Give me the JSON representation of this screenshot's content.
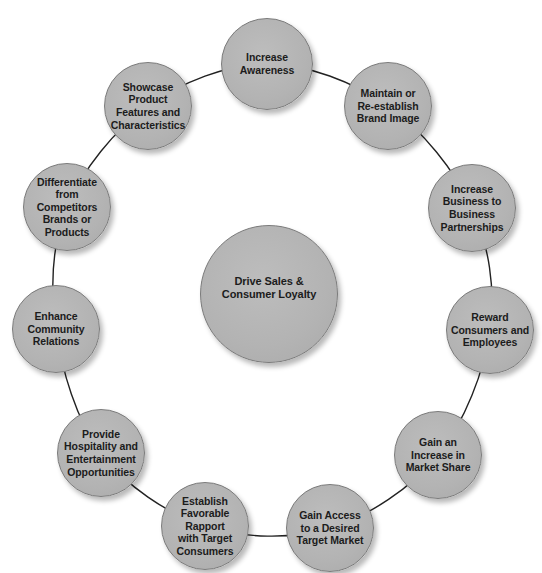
{
  "diagram": {
    "type": "hub-and-ring",
    "colors": {
      "node_fill": "#b5b5b5",
      "node_border": "#7a7a7a",
      "connector": "#222222",
      "text": "#1c1c1c",
      "background": "#ffffff"
    },
    "center": {
      "label": "Drive Sales &\nConsumer Loyalty",
      "x": 269,
      "y": 294,
      "r": 69
    },
    "ring_nodes": [
      {
        "id": "increase-awareness",
        "label": "Increase\nAwareness",
        "x": 267,
        "y": 64,
        "r": 46
      },
      {
        "id": "maintain-brand-image",
        "label": "Maintain or\nRe-establish\nBrand Image",
        "x": 388,
        "y": 106,
        "r": 44
      },
      {
        "id": "increase-b2b",
        "label": "Increase\nBusiness to\nBusiness\nPartnerships",
        "x": 472,
        "y": 208,
        "r": 44
      },
      {
        "id": "reward-consumers",
        "label": "Reward\nConsumers and\nEmployees",
        "x": 490,
        "y": 330,
        "r": 44
      },
      {
        "id": "increase-market-share",
        "label": "Gain an\nIncrease in\nMarket Share",
        "x": 438,
        "y": 455,
        "r": 44
      },
      {
        "id": "gain-access-target-market",
        "label": "Gain Access\nto a Desired\nTarget Market",
        "x": 330,
        "y": 528,
        "r": 44
      },
      {
        "id": "establish-rapport",
        "label": "Establish\nFavorable\nRapport\nwith Target\nConsumers",
        "x": 205,
        "y": 526,
        "r": 44
      },
      {
        "id": "provide-hospitality",
        "label": "Provide\nHospitality and\nEntertainment\nOpportunities",
        "x": 101,
        "y": 453,
        "r": 44
      },
      {
        "id": "enhance-community",
        "label": "Enhance\nCommunity\nRelations",
        "x": 56,
        "y": 329,
        "r": 44
      },
      {
        "id": "differentiate-competitors",
        "label": "Differentiate\nfrom\nCompetitors\nBrands or\nProducts",
        "x": 67,
        "y": 207,
        "r": 44
      },
      {
        "id": "showcase-features",
        "label": "Showcase\nProduct\nFeatures and\nCharacteristics",
        "x": 148,
        "y": 106,
        "r": 44
      }
    ]
  }
}
